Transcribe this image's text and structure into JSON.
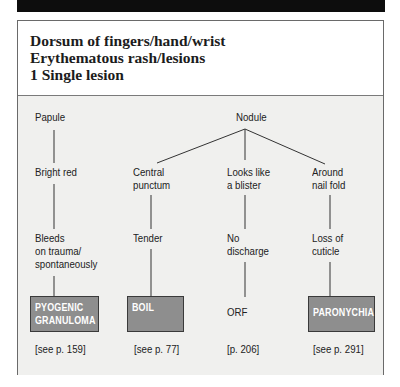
{
  "header_bar": {
    "text": ""
  },
  "title": {
    "lines": [
      "Dorsum of fingers/hand/wrist",
      "Erythematous rash/lesions",
      "1  Single lesion"
    ]
  },
  "diagram": {
    "roots": {
      "papule": "Papule",
      "nodule": "Nodule"
    },
    "level1": {
      "papule_child": "Bright red",
      "central_punctum": [
        "Central",
        "punctum"
      ],
      "looks_like_blister": [
        "Looks like",
        "a blister"
      ],
      "around_nail_fold": [
        "Around",
        "nail fold"
      ]
    },
    "level2": {
      "bleeds": [
        "Bleeds",
        "on trauma/",
        "spontaneously"
      ],
      "tender": "Tender",
      "no_discharge": [
        "No",
        "discharge"
      ],
      "loss_of_cuticle": [
        "Loss of",
        "cuticle"
      ]
    },
    "diagnoses": {
      "pyogenic": [
        "PYOGENIC",
        "GRANULOMA"
      ],
      "boil": "BOIL",
      "orf": "ORF",
      "paronychia": "PARONYCHIA"
    },
    "page_refs": {
      "pyogenic": "[see p. 159]",
      "boil": "[see p. 77]",
      "orf": "[p. 206]",
      "paronychia": "[see p. 291]"
    },
    "colors": {
      "diagnosis_box": "#8e8e8e",
      "diagram_background": "#f0f0ee",
      "header_bar": "#0d0d0d"
    }
  }
}
